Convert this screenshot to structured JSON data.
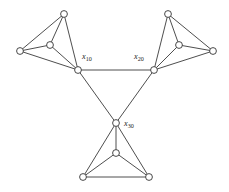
{
  "diagram": {
    "type": "undirected-graph",
    "title": "",
    "background_color": "#ffffff",
    "edge_color": "#3a3a3a",
    "node_fill": "#ffffff",
    "node_stroke": "#333333",
    "node_radius": 3.4,
    "labels": [
      {
        "id": "label-x10",
        "base": "x",
        "sub": "10",
        "x": 82,
        "y": 59
      },
      {
        "id": "label-x20",
        "base": "x",
        "sub": "20",
        "x": 134,
        "y": 59
      },
      {
        "id": "label-x30",
        "base": "x",
        "sub": "30",
        "x": 124,
        "y": 126
      }
    ],
    "nodes": [
      {
        "id": "n-left-top",
        "x": 64,
        "y": 14
      },
      {
        "id": "n-left-outer",
        "x": 20,
        "y": 51
      },
      {
        "id": "n-left-inner",
        "x": 50,
        "y": 45
      },
      {
        "id": "n-hub-x10",
        "x": 78,
        "y": 70
      },
      {
        "id": "n-right-top",
        "x": 168,
        "y": 14
      },
      {
        "id": "n-right-outer",
        "x": 213,
        "y": 51
      },
      {
        "id": "n-right-inner",
        "x": 179,
        "y": 45
      },
      {
        "id": "n-hub-x20",
        "x": 154,
        "y": 70
      },
      {
        "id": "n-hub-x30",
        "x": 116,
        "y": 123
      },
      {
        "id": "n-bottom-inner",
        "x": 116,
        "y": 153
      },
      {
        "id": "n-bottom-left",
        "x": 83,
        "y": 177
      },
      {
        "id": "n-bottom-right",
        "x": 149,
        "y": 177
      }
    ],
    "edges": [
      {
        "id": "e-lt-lo",
        "from": "n-left-top",
        "to": "n-left-outer"
      },
      {
        "id": "e-lt-li",
        "from": "n-left-top",
        "to": "n-left-inner"
      },
      {
        "id": "e-lt-h1",
        "from": "n-left-top",
        "to": "n-hub-x10"
      },
      {
        "id": "e-lo-li",
        "from": "n-left-outer",
        "to": "n-left-inner"
      },
      {
        "id": "e-lo-h1",
        "from": "n-left-outer",
        "to": "n-hub-x10"
      },
      {
        "id": "e-li-h1",
        "from": "n-left-inner",
        "to": "n-hub-x10"
      },
      {
        "id": "e-rt-ro",
        "from": "n-right-top",
        "to": "n-right-outer"
      },
      {
        "id": "e-rt-ri",
        "from": "n-right-top",
        "to": "n-right-inner"
      },
      {
        "id": "e-rt-h2",
        "from": "n-right-top",
        "to": "n-hub-x20"
      },
      {
        "id": "e-ro-ri",
        "from": "n-right-outer",
        "to": "n-right-inner"
      },
      {
        "id": "e-ro-h2",
        "from": "n-right-outer",
        "to": "n-hub-x20"
      },
      {
        "id": "e-ri-h2",
        "from": "n-right-inner",
        "to": "n-hub-x20"
      },
      {
        "id": "e-h3-bi",
        "from": "n-hub-x30",
        "to": "n-bottom-inner"
      },
      {
        "id": "e-h3-bl",
        "from": "n-hub-x30",
        "to": "n-bottom-left"
      },
      {
        "id": "e-h3-br",
        "from": "n-hub-x30",
        "to": "n-bottom-right"
      },
      {
        "id": "e-bi-bl",
        "from": "n-bottom-inner",
        "to": "n-bottom-left"
      },
      {
        "id": "e-bi-br",
        "from": "n-bottom-inner",
        "to": "n-bottom-right"
      },
      {
        "id": "e-bl-br",
        "from": "n-bottom-left",
        "to": "n-bottom-right"
      },
      {
        "id": "e-h1-h2",
        "from": "n-hub-x10",
        "to": "n-hub-x20"
      },
      {
        "id": "e-h1-h3",
        "from": "n-hub-x10",
        "to": "n-hub-x30"
      },
      {
        "id": "e-h2-h3",
        "from": "n-hub-x20",
        "to": "n-hub-x30"
      }
    ]
  }
}
